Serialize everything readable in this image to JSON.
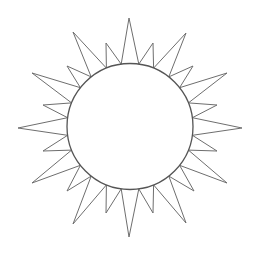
{
  "drawing": {
    "subject": "sun",
    "stroke_color": "#6e6e6e",
    "circle_color": "#555555",
    "background": "#ffffff",
    "center": [
      130,
      126.5
    ],
    "radius": 63,
    "long_rays": [
      {
        "tip": [
          242,
          128
        ],
        "base_deg": [
          -8,
          8
        ]
      },
      {
        "tip": [
          227,
          183
        ],
        "base_deg": [
          22,
          38
        ]
      },
      {
        "tip": [
          186,
          223
        ],
        "base_deg": [
          52,
          68
        ]
      },
      {
        "tip": [
          129,
          237
        ],
        "base_deg": [
          82,
          98
        ]
      },
      {
        "tip": [
          73,
          224
        ],
        "base_deg": [
          112,
          128
        ]
      },
      {
        "tip": [
          32,
          183
        ],
        "base_deg": [
          142,
          158
        ]
      },
      {
        "tip": [
          18,
          128
        ],
        "base_deg": [
          172,
          188
        ]
      },
      {
        "tip": [
          32,
          73
        ],
        "base_deg": [
          202,
          218
        ]
      },
      {
        "tip": [
          73,
          32
        ],
        "base_deg": [
          232,
          248
        ]
      },
      {
        "tip": [
          129,
          18
        ],
        "base_deg": [
          262,
          278
        ]
      },
      {
        "tip": [
          186,
          33
        ],
        "base_deg": [
          292,
          308
        ]
      },
      {
        "tip": [
          227,
          73
        ],
        "base_deg": [
          322,
          338
        ]
      }
    ],
    "short_rays": [
      {
        "tip": [
          217,
          151
        ],
        "base_deg": [
          8,
          22
        ]
      },
      {
        "tip": [
          194,
          191
        ],
        "base_deg": [
          38,
          52
        ]
      },
      {
        "tip": [
          153,
          213
        ],
        "base_deg": [
          68,
          82
        ]
      },
      {
        "tip": [
          106,
          213
        ],
        "base_deg": [
          98,
          112
        ]
      },
      {
        "tip": [
          67,
          191
        ],
        "base_deg": [
          128,
          142
        ]
      },
      {
        "tip": [
          43,
          151
        ],
        "base_deg": [
          158,
          172
        ]
      },
      {
        "tip": [
          43,
          105
        ],
        "base_deg": [
          188,
          202
        ]
      },
      {
        "tip": [
          67,
          66
        ],
        "base_deg": [
          218,
          232
        ]
      },
      {
        "tip": [
          106,
          43
        ],
        "base_deg": [
          248,
          262
        ]
      },
      {
        "tip": [
          153,
          43
        ],
        "base_deg": [
          278,
          292
        ]
      },
      {
        "tip": [
          193,
          66
        ],
        "base_deg": [
          308,
          322
        ]
      },
      {
        "tip": [
          217,
          105
        ],
        "base_deg": [
          338,
          352
        ]
      }
    ]
  }
}
